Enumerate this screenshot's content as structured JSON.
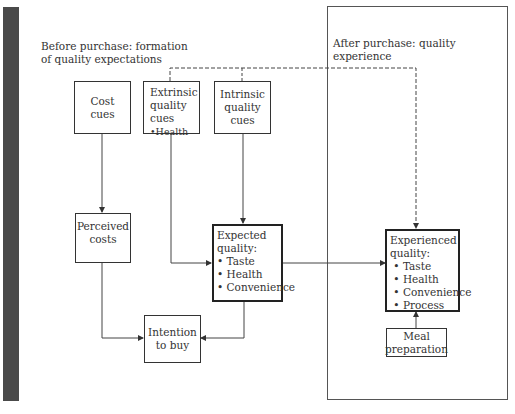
{
  "diagram": {
    "sections": {
      "before": {
        "lines": [
          "Before purchase: formation",
          "of quality expectations"
        ]
      },
      "after": {
        "lines": [
          "After purchase: quality",
          "experience"
        ]
      }
    },
    "nodes": {
      "cost_cues": {
        "lines": [
          "Cost",
          "cues"
        ]
      },
      "extrinsic": {
        "lines": [
          "Extrinsic",
          "quality",
          "cues"
        ],
        "bullets": [
          "Health"
        ]
      },
      "intrinsic": {
        "lines": [
          "Intrinsic",
          "quality",
          "cues"
        ]
      },
      "perceived_costs": {
        "lines": [
          "Perceived",
          "costs"
        ]
      },
      "expected_quality": {
        "lines": [
          "Expected",
          "quality:"
        ],
        "bullets": [
          "Taste",
          "Health",
          "Convenience"
        ]
      },
      "intention_to_buy": {
        "lines": [
          "Intention",
          "to buy"
        ]
      },
      "experienced_quality": {
        "lines": [
          "Experienced",
          "quality:"
        ],
        "bullets": [
          "Taste",
          "Health",
          "Convenience",
          "Process"
        ]
      },
      "meal_preparation": {
        "lines": [
          "Meal",
          "preparation"
        ]
      }
    },
    "edges": [
      {
        "from": "cost_cues",
        "to": "perceived_costs",
        "style": "solid"
      },
      {
        "from": "extrinsic",
        "to": "expected_quality",
        "style": "solid"
      },
      {
        "from": "intrinsic",
        "to": "expected_quality",
        "style": "solid"
      },
      {
        "from": "perceived_costs",
        "to": "intention_to_buy",
        "style": "solid"
      },
      {
        "from": "expected_quality",
        "to": "intention_to_buy",
        "style": "solid"
      },
      {
        "from": "expected_quality",
        "to": "experienced_quality",
        "style": "solid"
      },
      {
        "from": "meal_preparation",
        "to": "experienced_quality",
        "style": "solid"
      },
      {
        "from": "extrinsic",
        "to": "experienced_quality",
        "style": "dashed"
      },
      {
        "from": "intrinsic",
        "to": "experienced_quality",
        "style": "dashed"
      }
    ],
    "bullet_char": "•"
  }
}
